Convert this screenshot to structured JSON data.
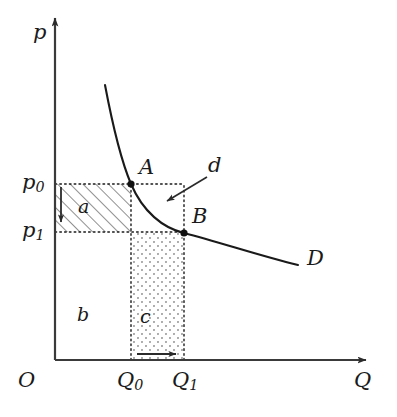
{
  "figure": {
    "type": "economics-demand-curve-diagram",
    "background_color": "#ffffff",
    "line_color": "#1a1a1a"
  },
  "axes": {
    "y_label": "p",
    "x_label": "Q",
    "origin_label": "O",
    "y_ticks": [
      {
        "label_main": "p",
        "label_sub": "0",
        "y_px": 184
      },
      {
        "label_main": "p",
        "label_sub": "1",
        "y_px": 232
      }
    ],
    "x_ticks": [
      {
        "label_main": "Q",
        "label_sub": "0",
        "x_px": 131
      },
      {
        "label_main": "Q",
        "label_sub": "1",
        "x_px": 184
      }
    ]
  },
  "points": [
    {
      "name": "A",
      "label": "A",
      "x_px": 131,
      "y_px": 184
    },
    {
      "name": "B",
      "label": "B",
      "x_px": 184,
      "y_px": 233
    }
  ],
  "curve": {
    "label": "D",
    "description": "downward-sloping convex demand curve"
  },
  "annotations": [
    {
      "name": "shift-annotation",
      "label": "d"
    }
  ],
  "regions": [
    {
      "name": "region-a",
      "label": "a",
      "fill": "hatched",
      "description": "hatched rectangle between p0 and p1 from y-axis to Q0"
    },
    {
      "name": "region-b",
      "label": "b",
      "fill": "none",
      "description": "unshaded rectangle below p1 from y-axis to Q0"
    },
    {
      "name": "region-c",
      "label": "c",
      "fill": "dotted",
      "description": "stippled rectangle below p1 from Q0 to Q1"
    }
  ],
  "arrows": [
    {
      "name": "price-decrease-arrow",
      "direction": "down",
      "description": "vertical arrow from p0 down to p1"
    },
    {
      "name": "quantity-increase-arrow",
      "direction": "right",
      "description": "horizontal arrow from Q0 to Q1 along x-axis"
    },
    {
      "name": "demand-pointer-arrow",
      "direction": "down-left",
      "description": "arrow from label d pointing at the demand curve"
    }
  ]
}
